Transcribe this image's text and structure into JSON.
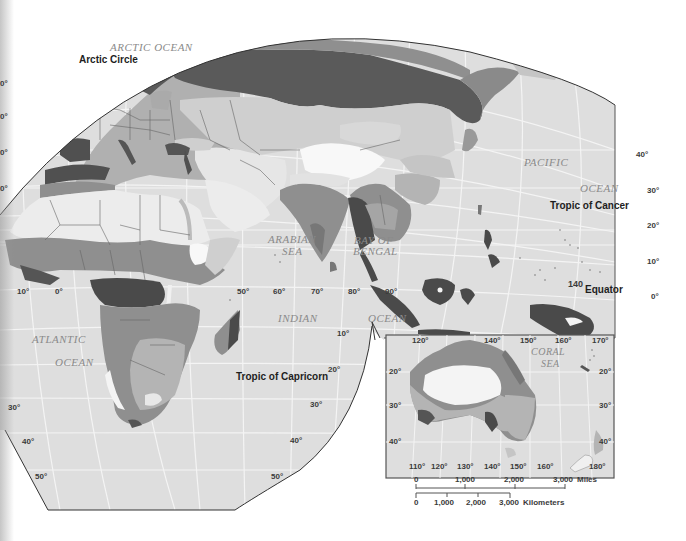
{
  "map": {
    "type": "climate-regions-world-map",
    "colors": {
      "ocean": "#dedede",
      "grid": "#f4f4f4",
      "border": "#555555",
      "region_lightest": "#f6f6f6",
      "region_light": "#cfcfcf",
      "region_medium_light": "#b4b4b4",
      "region_medium": "#8f8f8f",
      "region_dark": "#5a5a5a",
      "region_darkest": "#4a4a4a",
      "frame": "#555555"
    },
    "water_labels": {
      "arctic_ocean": "ARCTIC OCEAN",
      "pacific": "PACIFIC",
      "pacific_ocean": "OCEAN",
      "arabian": "ARABIAN",
      "arabian_sea": "SEA",
      "bay_of": "BAY OF",
      "bengal": "BENGAL",
      "indian": "INDIAN",
      "indian_ocean": "OCEAN",
      "atlantic": "ATLANTIC",
      "atlantic_ocean": "OCEAN",
      "coral": "CORAL",
      "coral_sea": "SEA"
    },
    "reference_lines": {
      "arctic_circle": "Arctic Circle",
      "tropic_of_cancer": "Tropic of Cancer",
      "equator": "Equator",
      "tropic_of_capricorn": "Tropic of Capricorn"
    },
    "longitude_labels_main": [
      "10°",
      "0°",
      "50°",
      "60°",
      "70°",
      "80°",
      "90°"
    ],
    "latitude_labels_left": [
      "0°",
      "0°",
      "0°",
      "0°",
      "30°",
      "40°",
      "50°"
    ],
    "latitude_labels_right": [
      "40°",
      "30°",
      "20°",
      "10°",
      "0°"
    ],
    "latitude_labels_south_edge": [
      "10°",
      "20°",
      "30°",
      "40°",
      "50°"
    ],
    "misc_label_140": "140",
    "inset": {
      "name": "Australia and New Zealand",
      "top_longitudes": [
        "120°",
        "140°",
        "150°",
        "160°",
        "170°"
      ],
      "bottom_longitudes": [
        "110°",
        "120°",
        "130°",
        "140°",
        "150°",
        "160°",
        "180°"
      ],
      "left_latitudes": [
        "20°",
        "30°",
        "40°"
      ],
      "right_latitudes": [
        "20°",
        "30°",
        "40°"
      ]
    },
    "scale_bar": {
      "miles": {
        "ticks": [
          "0",
          "1,000",
          "2,000",
          "3,000"
        ],
        "unit": "Miles"
      },
      "kilometers": {
        "ticks": [
          "0",
          "1,000",
          "2,000",
          "3,000"
        ],
        "unit": "Kilometers"
      }
    }
  }
}
